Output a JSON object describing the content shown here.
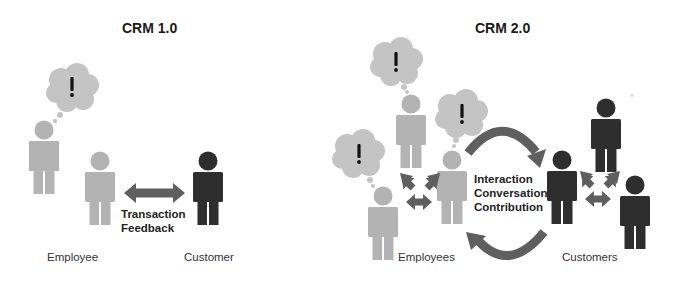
{
  "colors": {
    "employee": "#b3b3b3",
    "customer": "#2e2e2e",
    "arrow": "#5f5f5f",
    "cloud": "#c4c4c4",
    "exclamation": "#111111",
    "background": "#ffffff"
  },
  "panels": [
    {
      "title": "CRM 1.0",
      "relation_lines": [
        "Transaction",
        "Feedback"
      ],
      "left_label": "Employee",
      "right_label": "Customer",
      "thought_symbol": "!"
    },
    {
      "title": "CRM 2.0",
      "relation_lines": [
        "Interaction",
        "Conversation",
        "Contribution"
      ],
      "left_label": "Employees",
      "right_label": "Customers",
      "thought_symbol": "!"
    }
  ],
  "icons": {
    "person": "person-icon",
    "thought_bubble": "thought-bubble-icon",
    "double_arrow": "double-arrow-icon",
    "curved_arrow": "curved-arrow-icon",
    "cycle_arrows": "cycle-arrows-icon"
  }
}
